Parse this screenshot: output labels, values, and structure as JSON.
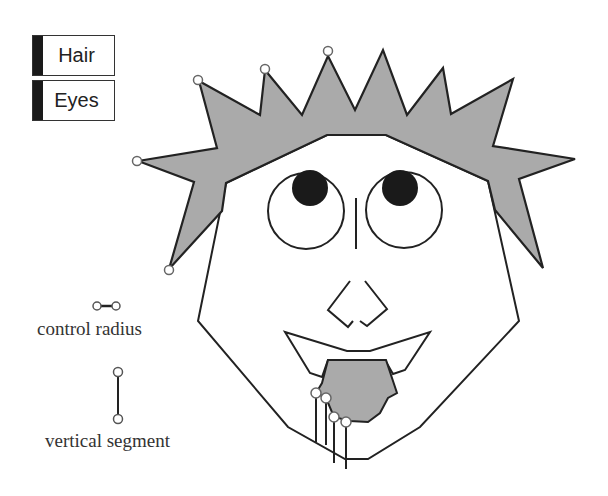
{
  "buttons": [
    {
      "id": "hair",
      "label": "Hair"
    },
    {
      "id": "eyes",
      "label": "Eyes"
    }
  ],
  "legend": {
    "control_radius_label": "control radius",
    "vertical_segment_label": "vertical segment"
  },
  "colors": {
    "hair_fill": "#aaaaaa",
    "tongue_fill": "#aaaaaa",
    "stroke": "#222222",
    "pupil": "#1a1a1a",
    "control_point_stroke": "#666666"
  }
}
